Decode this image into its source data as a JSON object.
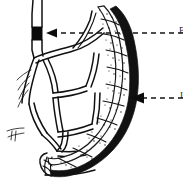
{
  "figure": {
    "style": "black-and-white pen-and-ink medical line drawing",
    "background_color": "#ffffff",
    "ink_color": "#111111",
    "width": 183,
    "height": 188
  },
  "labels": {
    "embolus": {
      "name": "embolus-label",
      "text": "E",
      "cropped": true,
      "leader_from_x": 183,
      "leader_to_x": 48,
      "leader_y": 33
    },
    "bowel": {
      "name": "infarcted-bowel-label",
      "text": "I",
      "cropped": true,
      "leader_from_x": 183,
      "leader_to_x": 133,
      "leader_y": 98
    }
  },
  "structures": {
    "artery": {
      "name": "superior-mesenteric-artery",
      "description": "vertical double-line arterial trunk entering from top-left"
    },
    "embolus_plug": {
      "name": "embolus-plug",
      "description": "solid black occluding plug within the artery",
      "color": "#0a0a0a",
      "x": 32,
      "y": 27,
      "width": 10,
      "height": 13
    },
    "mesentery": {
      "name": "mesenteric-vessel-arcade",
      "description": "network of branching arcade vessels drawn as double outlines"
    },
    "bowel_loop": {
      "name": "infarcted-bowel-loop",
      "description": "C-shaped segmented bowel loop, darkly stippled and shaded indicating infarction",
      "segment_count": 9
    }
  },
  "arrowheads": [
    {
      "name": "embolus-arrowhead",
      "x": 48,
      "y": 33,
      "direction": "left"
    },
    {
      "name": "bowel-arrowhead",
      "x": 133,
      "y": 98,
      "direction": "left"
    }
  ]
}
